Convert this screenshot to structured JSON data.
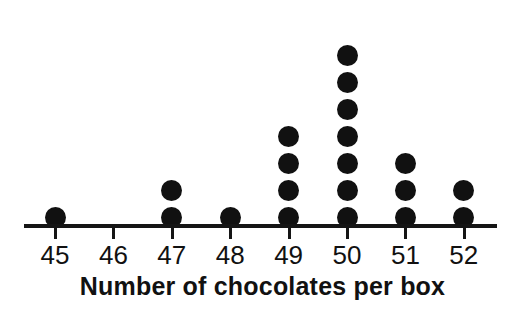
{
  "chart_data": {
    "type": "dotplot",
    "title": "",
    "xlabel": "Number of chocolates per box",
    "ylabel": "",
    "categories": [
      "45",
      "46",
      "47",
      "48",
      "49",
      "50",
      "51",
      "52"
    ],
    "values": [
      1,
      0,
      2,
      1,
      4,
      7,
      3,
      2
    ],
    "tick_labels": [
      "45",
      "46",
      "47",
      "48",
      "49",
      "50",
      "51",
      "52"
    ],
    "xlim": [
      45,
      52
    ],
    "grid": false,
    "legend": "none",
    "dot_color": "#111111",
    "axis_color": "#151515",
    "background_color": "#ffffff",
    "total_count": 20
  },
  "axis": {
    "title": "Number of chocolates per box"
  }
}
